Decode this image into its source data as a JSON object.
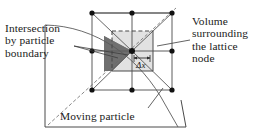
{
  "figure": {
    "background": "#ffffff",
    "width": 267,
    "height": 135
  },
  "labels": {
    "intersection": {
      "name": "intersection-by-particle-boundary",
      "line1": "Intersection",
      "line2": "by particle",
      "line3": "boundary"
    },
    "volume": {
      "name": "volume-surrounding-the-lattice-node",
      "line1": "Volume",
      "line2": "surrounding",
      "line3": "the lattice",
      "line4": "node"
    },
    "moving": {
      "name": "moving-particle",
      "text": "Moving particle"
    },
    "spacing": {
      "name": "lattice-spacing",
      "text": "Δx"
    }
  },
  "colors": {
    "stroke": "#3a3a3a",
    "line_light": "#6e6e6e",
    "node_fill": "#111111",
    "intersection_fill": "#707070",
    "volume_fill": "#e2e2e2",
    "text": "#1a1a1a",
    "background": "#ffffff"
  },
  "geometry": {
    "lattice": {
      "columns_x": [
        92,
        132,
        172
      ],
      "rows_y": [
        13,
        51,
        90
      ],
      "node_radius": 2.6,
      "node_count": 9,
      "center_node": [
        132,
        51
      ]
    },
    "control_volume": {
      "x": 112,
      "y": 31,
      "width": 41,
      "height": 40,
      "fill": "#e2e2e2",
      "dashed_edges": [
        "top",
        "left"
      ]
    },
    "particle_boundary": {
      "type": "arc",
      "description": "large circular arc sweeping from upper-left to lower-left through the lattice cell"
    },
    "intersection_polygon": {
      "description": "dark shaded region bounded by cell edges and the particle boundary arc",
      "fill": "#707070"
    },
    "outer_frame": {
      "description": "slightly skewed quadrilateral enclosing the moving-particle caption region"
    }
  }
}
